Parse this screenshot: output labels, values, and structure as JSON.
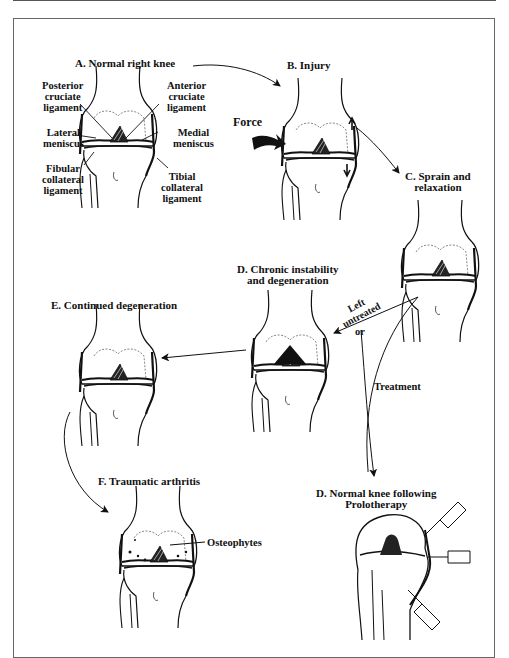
{
  "figure": {
    "panels": {
      "a": {
        "title": "A. Normal right knee",
        "labels": {
          "posterior_cruciate": [
            "Posterior",
            "cruciate",
            "ligament"
          ],
          "anterior_cruciate": [
            "Anterior",
            "cruciate",
            "ligament"
          ],
          "lateral_meniscus": [
            "Lateral",
            "meniscus"
          ],
          "medial_meniscus": [
            "Medial",
            "meniscus"
          ],
          "fibular_collateral": [
            "Fibular",
            "collateral",
            "ligament"
          ],
          "tibial_collateral": [
            "Tibial",
            "collateral",
            "ligament"
          ]
        }
      },
      "b": {
        "title": "B. Injury",
        "force_label": "Force"
      },
      "c": {
        "title": [
          "C. Sprain and",
          "relaxation"
        ]
      },
      "d_chronic": {
        "title": [
          "D. Chronic instability",
          "and degeneration"
        ]
      },
      "e": {
        "title": "E. Continued degeneration"
      },
      "f": {
        "title": "F. Traumatic arthritis",
        "osteophytes_label": "Osteophytes"
      },
      "d_normal": {
        "title": [
          "D. Normal knee following",
          "Prolotherapy"
        ]
      }
    },
    "arrows": {
      "left_untreated": [
        "Left",
        "untreated"
      ],
      "or": "or",
      "treatment": "Treatment"
    },
    "colors": {
      "ink": "#111111",
      "frame": "#666666",
      "background": "#ffffff"
    }
  }
}
